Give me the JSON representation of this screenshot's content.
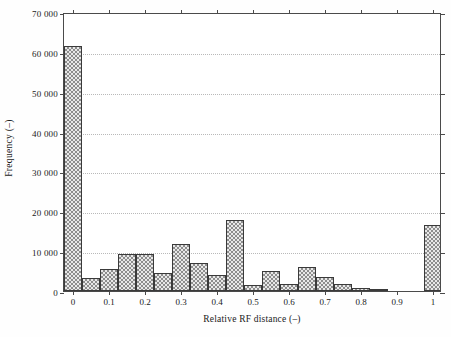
{
  "chart_data": {
    "type": "bar",
    "title": "",
    "subtitle": "",
    "xlabel": "Relative RF distance (–)",
    "ylabel": "Frequency (–)",
    "xlim": [
      -0.025,
      1.025
    ],
    "ylim": [
      0,
      70000
    ],
    "grid": "horizontal-dotted",
    "legend": "none",
    "bin_width": 0.05,
    "x_tick_labels": [
      "0",
      "0.1",
      "0.2",
      "0.3",
      "0.4",
      "0.5",
      "0.6",
      "0.7",
      "0.8",
      "0.9",
      "1"
    ],
    "x_tick_values": [
      0,
      0.1,
      0.2,
      0.3,
      0.4,
      0.5,
      0.6,
      0.7,
      0.8,
      0.9,
      1
    ],
    "y_tick_labels": [
      "0",
      "10 000",
      "20 000",
      "30 000",
      "40 000",
      "50 000",
      "60 000",
      "70 000"
    ],
    "y_tick_values": [
      0,
      10000,
      20000,
      30000,
      40000,
      50000,
      60000,
      70000
    ],
    "bin_edges": [
      -0.025,
      0.025,
      0.075,
      0.125,
      0.175,
      0.225,
      0.275,
      0.325,
      0.375,
      0.425,
      0.475,
      0.525,
      0.575,
      0.625,
      0.675,
      0.725,
      0.775,
      0.825,
      0.875,
      0.925,
      0.975,
      1.025
    ],
    "bin_centers": [
      0,
      0.05,
      0.1,
      0.15,
      0.2,
      0.25,
      0.3,
      0.35,
      0.4,
      0.45,
      0.5,
      0.55,
      0.6,
      0.65,
      0.7,
      0.75,
      0.8,
      0.85,
      0.9,
      0.95,
      1.0
    ],
    "values": [
      61500,
      3200,
      5500,
      9300,
      9300,
      4500,
      11900,
      7100,
      4000,
      17900,
      1400,
      4900,
      1800,
      6100,
      3500,
      1700,
      700,
      400,
      0,
      0,
      16500
    ],
    "categories": [
      "0.00",
      "0.05",
      "0.10",
      "0.15",
      "0.20",
      "0.25",
      "0.30",
      "0.35",
      "0.40",
      "0.45",
      "0.50",
      "0.55",
      "0.60",
      "0.65",
      "0.70",
      "0.75",
      "0.80",
      "0.85",
      "0.90",
      "0.95",
      "1.00"
    ],
    "bar_style": "checkerboard-hatch-gray",
    "bar_edge_color": "#3a3a3a",
    "bar_fill_color": "#8d8d8d",
    "grid_color": "#b9b9b9",
    "axis_color": "#4a4a4a"
  }
}
